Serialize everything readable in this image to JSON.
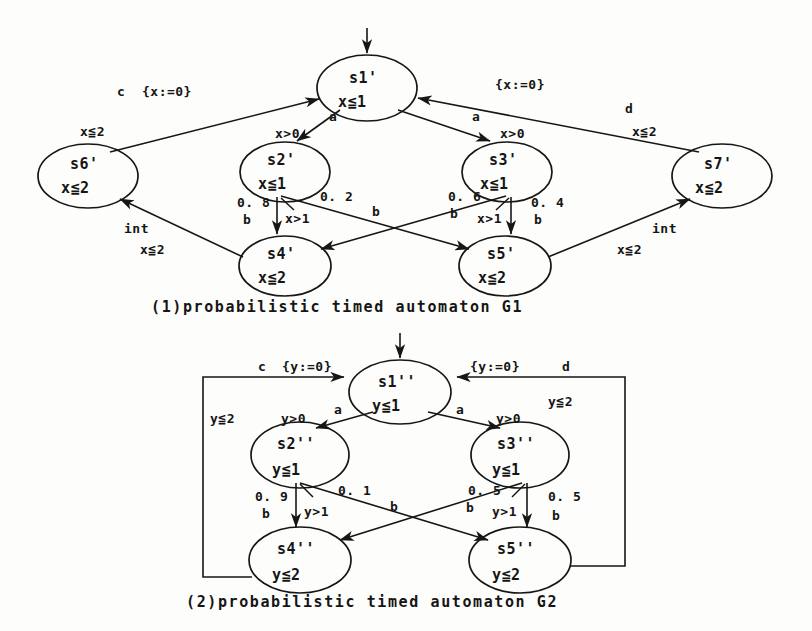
{
  "figure": {
    "kind": "two probabilistic timed automata diagrams"
  },
  "diagram1": {
    "caption": "(1)probabilistic timed automaton G1",
    "nodes": [
      {
        "id": "s1p",
        "name": "s1'",
        "invariant": "x≦1",
        "cx": 367,
        "cy": 88,
        "rx": 50,
        "ry": 33
      },
      {
        "id": "s2p",
        "name": "s2'",
        "invariant": "x≦1",
        "cx": 285,
        "cy": 172,
        "rx": 45,
        "ry": 30
      },
      {
        "id": "s3p",
        "name": "s3'",
        "invariant": "x≦1",
        "cx": 507,
        "cy": 172,
        "rx": 45,
        "ry": 30
      },
      {
        "id": "s4p",
        "name": "s4'",
        "invariant": "x≦2",
        "cx": 285,
        "cy": 266,
        "rx": 46,
        "ry": 30
      },
      {
        "id": "s5p",
        "name": "s5'",
        "invariant": "x≦2",
        "cx": 505,
        "cy": 266,
        "rx": 46,
        "ry": 30
      },
      {
        "id": "s6p",
        "name": "s6'",
        "invariant": "x≦2",
        "cx": 88,
        "cy": 176,
        "rx": 50,
        "ry": 32
      },
      {
        "id": "s7p",
        "name": "s7'",
        "invariant": "x≦2",
        "cx": 722,
        "cy": 176,
        "rx": 50,
        "ry": 32
      }
    ],
    "edge_labels": {
      "c_reset": "c  {x:=0}",
      "c_guard": "x≦2",
      "d_reset": "{x:=0}",
      "d_letter": "d",
      "d_guard": "x≦2",
      "a_left": "a",
      "a_left_guard": "x>0",
      "a_right": "a",
      "a_right_guard": "x>0",
      "p08": "0. 8",
      "b_left_down": "b",
      "guard_left_x": "x>1",
      "p02": "0. 2",
      "b_left_cross": "b",
      "p06": "0. 6",
      "b_right_cross": "b",
      "guard_right_x": "x>1",
      "p04": "0. 4",
      "b_right_down": "b",
      "int_left": "int",
      "int_left_guard": "x≦2",
      "int_right": "int",
      "int_right_guard": "x≦2"
    }
  },
  "diagram2": {
    "caption": "(2)probabilistic timed automaton G2",
    "nodes": [
      {
        "id": "s1pp",
        "name": "s1''",
        "invariant": "y≦1",
        "cx": 400,
        "cy": 392,
        "rx": 51,
        "ry": 32
      },
      {
        "id": "s2pp",
        "name": "s2''",
        "invariant": "y≦1",
        "cx": 300,
        "cy": 455,
        "rx": 49,
        "ry": 33
      },
      {
        "id": "s3pp",
        "name": "s3''",
        "invariant": "y≦1",
        "cx": 520,
        "cy": 455,
        "rx": 49,
        "ry": 33
      },
      {
        "id": "s4pp",
        "name": "s4''",
        "invariant": "y≦2",
        "cx": 300,
        "cy": 560,
        "rx": 51,
        "ry": 33
      },
      {
        "id": "s5pp",
        "name": "s5''",
        "invariant": "y≦2",
        "cx": 520,
        "cy": 560,
        "rx": 51,
        "ry": 33
      }
    ],
    "edge_labels": {
      "c_letter": "c",
      "c_reset": "{y:=0}",
      "c_guard": "y≦2",
      "d_reset": "{y:=0}",
      "d_letter": "d",
      "d_guard": "y≦2",
      "a_left": "a",
      "a_left_guard": "y>0",
      "a_right": "a",
      "a_right_guard": "y>0",
      "p09": "0. 9",
      "b_left_down": "b",
      "guard_left_y": "y>1",
      "p01": "0. 1",
      "b_left_cross": "b",
      "p05_left": "0. 5",
      "b_right_cross": "b",
      "guard_right_y": "y>1",
      "p05_right": "0. 5",
      "b_right_down": "b"
    }
  },
  "colors": {
    "ink": "#161616",
    "paper": "#fdfdfb"
  }
}
